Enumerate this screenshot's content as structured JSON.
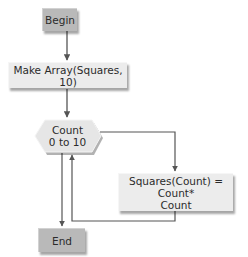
{
  "diagram": {
    "type": "flowchart",
    "nodes": {
      "begin": {
        "label": "Begin",
        "shape": "terminal"
      },
      "make_array": {
        "label": "Make Array(Squares, 10)",
        "shape": "process"
      },
      "loop": {
        "line1": "Count",
        "line2": "0 to 10",
        "shape": "loop-hexagon"
      },
      "squares": {
        "line1": "Squares(Count) = Count*",
        "line2": "Count",
        "shape": "process"
      },
      "end": {
        "label": "End",
        "shape": "terminal"
      }
    },
    "edges": [
      {
        "from": "begin",
        "to": "make_array"
      },
      {
        "from": "make_array",
        "to": "loop"
      },
      {
        "from": "loop",
        "to": "squares",
        "label": ""
      },
      {
        "from": "squares",
        "to": "loop",
        "label": ""
      },
      {
        "from": "loop",
        "to": "end",
        "label": ""
      }
    ],
    "colors": {
      "terminal_fill": "#b9b9b9",
      "process_fill": "#ececec",
      "line": "#555555"
    }
  }
}
